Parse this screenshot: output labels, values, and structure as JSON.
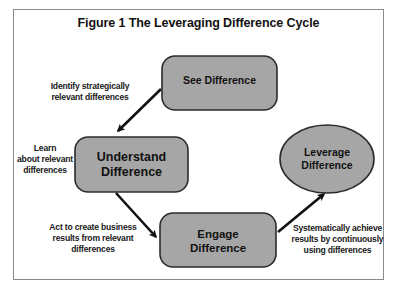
{
  "figure": {
    "title": "Figure 1 The Leveraging Difference Cycle"
  },
  "colors": {
    "node_fill": "#a6a6a6",
    "node_stroke": "#2b2b2b",
    "arrow": "#111111",
    "frame_border": "#8a8a8a"
  },
  "nodes": [
    {
      "id": "see",
      "shape": "rounded-rect",
      "lines": [
        "See Difference"
      ]
    },
    {
      "id": "understand",
      "shape": "rounded-rect",
      "lines": [
        "Understand",
        "Difference"
      ]
    },
    {
      "id": "engage",
      "shape": "rounded-rect",
      "lines": [
        "Engage",
        "Difference"
      ]
    },
    {
      "id": "leverage",
      "shape": "ellipse",
      "lines": [
        "Leverage",
        "Difference"
      ]
    }
  ],
  "edges": [
    {
      "from": "see",
      "to": "understand",
      "label_lines": [
        "Identify strategically",
        "relevant differences"
      ]
    },
    {
      "from": "understand",
      "to": "engage",
      "label_lines": [
        "Act to create business",
        "results from relevant",
        "differences"
      ]
    },
    {
      "from": "engage",
      "to": "leverage",
      "label_lines": [
        "Systematically achieve",
        "results by continuously",
        "using differences"
      ]
    }
  ],
  "annotations": {
    "understand_side": [
      "Learn",
      "about relevant",
      "differences"
    ]
  }
}
